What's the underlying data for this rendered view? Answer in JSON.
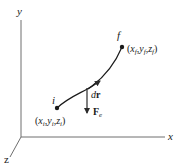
{
  "diagram": {
    "type": "work-path-3d",
    "colors": {
      "axis": "#6e6e6e",
      "curve": "#1a1a1a",
      "arrow": "#2a2a2a",
      "text": "#1a1a1a",
      "background": "#ffffff"
    },
    "axes": {
      "x_label": "x",
      "y_label": "y",
      "z_label": "z"
    },
    "points": {
      "initial": {
        "name": "i",
        "coord_open": "(",
        "x": "x",
        "x_sub": "i",
        "y": "y",
        "y_sub": "i",
        "z": "z",
        "z_sub": "i",
        "coord_close": ")",
        "sep": ","
      },
      "final": {
        "name": "f",
        "coord_open": "(",
        "x": "x",
        "x_sub": "f",
        "y": "y",
        "y_sub": "f",
        "z": "z",
        "z_sub": "f",
        "coord_close": ")",
        "sep": ","
      }
    },
    "vectors": {
      "displacement": {
        "d": "d",
        "r": "r"
      },
      "force": {
        "F": "F",
        "sub": "e"
      }
    }
  }
}
